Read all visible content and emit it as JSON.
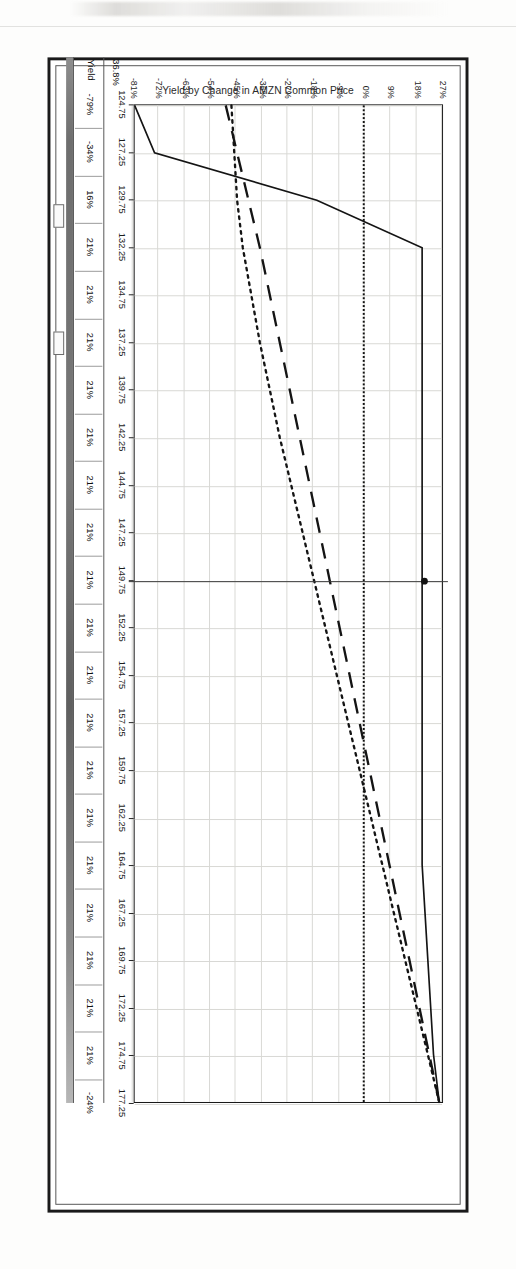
{
  "page": {
    "source_credit": "Source: OptionVue 6"
  },
  "chart_data": {
    "type": "line",
    "title": "Yield by Change in AMZN Common Price",
    "xlabel": "",
    "ylabel": "",
    "x": [
      124.75,
      127.25,
      129.75,
      132.25,
      134.75,
      137.25,
      139.75,
      142.25,
      144.75,
      147.25,
      149.75,
      152.25,
      154.75,
      157.25,
      159.75,
      162.25,
      164.75,
      167.25,
      169.75,
      172.25,
      174.75,
      177.25
    ],
    "xtick_labels": [
      "124.75",
      "127.25",
      "129.75",
      "132.25",
      "134.75",
      "137.25",
      "139.75",
      "142.25",
      "144.75",
      "147.25",
      "149.75",
      "152.25",
      "154.75",
      "157.25",
      "159.75",
      "162.25",
      "164.75",
      "167.25",
      "169.75",
      "172.25",
      "174.75",
      "177.25"
    ],
    "ytick_labels": [
      "27%",
      "18%",
      "9%",
      "0%",
      "-9%",
      "-18%",
      "-27%",
      "-36%",
      "-45%",
      "-54%",
      "-63%",
      "-72%",
      "-81%"
    ],
    "ytick_values": [
      27,
      18,
      9,
      0,
      -9,
      -18,
      -27,
      -36,
      -45,
      -54,
      -63,
      -72,
      -81
    ],
    "ylim": [
      -81,
      27
    ],
    "xlim": [
      124.75,
      177.25
    ],
    "grid": true,
    "legend_position": "none",
    "current_price": 149.75,
    "current_yield": 21,
    "zero_reference": 0,
    "series": [
      {
        "name": "Expiration",
        "style": "solid",
        "values": [
          -81,
          -74,
          -17,
          20,
          20,
          20,
          20,
          20,
          20,
          20,
          20,
          20,
          20,
          20,
          20,
          20,
          20,
          21,
          22,
          23,
          24,
          26
        ]
      },
      {
        "name": "Today",
        "style": "long-dash",
        "values": [
          -49,
          -45,
          -41,
          -37,
          -33.5,
          -30,
          -26.5,
          -23,
          -19.5,
          -16,
          -12.5,
          -9,
          -5.5,
          -2,
          1.5,
          5,
          8.5,
          12,
          15.5,
          19,
          22.5,
          26
        ]
      },
      {
        "name": "Midpoint",
        "style": "dotted",
        "values": [
          -47,
          -46,
          -45,
          -43,
          -40,
          -37,
          -33.5,
          -30,
          -26,
          -22,
          -18,
          -14,
          -10,
          -6,
          -2,
          2,
          6,
          10,
          14,
          18,
          22,
          26
        ]
      }
    ]
  },
  "yield_strip": {
    "label": "Yield",
    "left_value": "36.8%",
    "values": [
      "-79%",
      "-34%",
      "16%",
      "21%",
      "21%",
      "21%",
      "21%",
      "21%",
      "21%",
      "21%",
      "21%",
      "21%",
      "21%",
      "21%",
      "21%",
      "21%",
      "21%",
      "21%",
      "21%",
      "21%",
      "21%",
      "-24%"
    ]
  }
}
